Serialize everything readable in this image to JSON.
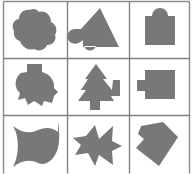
{
  "figure": {
    "width": 194,
    "height": 174,
    "background_color": "#ffffff",
    "shape_fill_color": "#787878",
    "grid_line_color": "#808080",
    "border_color": "#8a8a8a",
    "grid": {
      "rows": 3,
      "columns": 3,
      "cell_width": 62,
      "cell_height": 57,
      "column_dividers_x": [
        67.5,
        129.5
      ],
      "row_dividers_y": [
        58.5,
        115.5
      ],
      "outer_border_x": [
        3.5,
        189.5
      ],
      "outer_border_y": [
        1.5,
        173.5
      ]
    }
  },
  "cells": [
    {
      "index": 1,
      "row": 1,
      "column": 1,
      "name": "cloud-blob-shape",
      "description": "rounded multi-lobed cloud / blob silhouette",
      "path": "M30 10 C24 9 19 13 19 19 C13 20 11 26 14 31 C13 36 16 40 20 41 C22 47 28 51 34 49 C39 52 45 50 47 45 C53 45 57 40 55 35 C58 30 56 24 51 22 C51 15 45 10 39 12 C37 9 33 8 30 10 Z"
    },
    {
      "index": 2,
      "row": 1,
      "column": 2,
      "name": "triangle-with-blob-shape",
      "description": "upright triangle overlapping a rounded blob on its lower-left",
      "path": "M100 8 L119 47 L83 47 L83 40 C78 45 70 45 68 39 C66 34 70 29 75 29 L81 29 L100 8 Z M84 46 C86 52 94 52 96 46 L84 46 Z"
    },
    {
      "index": 3,
      "row": 1,
      "column": 3,
      "name": "square-with-top-bump-shape",
      "description": "square with a semicircular bump centered on its top edge",
      "path": "M145 16 L152 16 A8 8 0 0 1 168 16 L175 16 L175 45 L145 45 Z"
    },
    {
      "index": 4,
      "row": 2,
      "column": 1,
      "name": "circle-with-top-tab-shape",
      "description": "round blob with a rectangular tab on top and notched lower edges",
      "path": "M27 64 L42 64 L42 72 C50 74 55 81 54 88 L58 92 L54 96 L52 103 L44 101 L42 106 L34 101 L28 105 L25 98 L18 100 L20 93 C14 88 14 78 21 73 L27 72 Z"
    },
    {
      "index": 5,
      "row": 2,
      "column": 2,
      "name": "tree-arrow-shape",
      "description": "pine-tree / arrow silhouette with a stepped notch on the right side",
      "path": "M96 64 L107 79 L103 79 L112 90 L113 80 L120 80 L120 96 L111 96 L114 101 L100 101 L100 110 L90 110 L90 101 L78 101 L86 90 L81 90 L88 79 L85 79 Z"
    },
    {
      "index": 6,
      "row": 2,
      "column": 3,
      "name": "square-with-left-tab-shape",
      "description": "square with a small rectangular tab protruding from its left side",
      "path": "M137 80 L145 80 L145 70 L175 70 L175 99 L145 99 L145 91 L137 91 Z"
    },
    {
      "index": 7,
      "row": 3,
      "column": 1,
      "name": "curved-flag-shape",
      "description": "flag / bowtie shape with concave curved left and right edges",
      "path": "M13 126 C22 133 30 134 38 130 C45 127 52 127 58 132 L58 122 C58 122 61 137 58 148 C55 159 46 167 38 163 C30 159 22 160 13 167 C19 156 20 137 13 126 Z"
    },
    {
      "index": 8,
      "row": 3,
      "column": 2,
      "name": "arrow-star-shape",
      "description": "five-point star-like arrow pointing left with angular notches",
      "path": "M95 125 L99 139 L113 126 L112 141 L122 146 L112 151 L113 165 L99 155 L95 166 L88 153 L75 155 L81 145 L73 138 L86 136 Z"
    },
    {
      "index": 9,
      "row": 3,
      "column": 3,
      "name": "angular-kite-shape",
      "description": "rotated quadrilateral / kite with a pointed notch at its upper-left",
      "path": "M141 126 L163 122 L178 137 L159 166 L136 148 L144 139 L138 134 Z"
    }
  ]
}
